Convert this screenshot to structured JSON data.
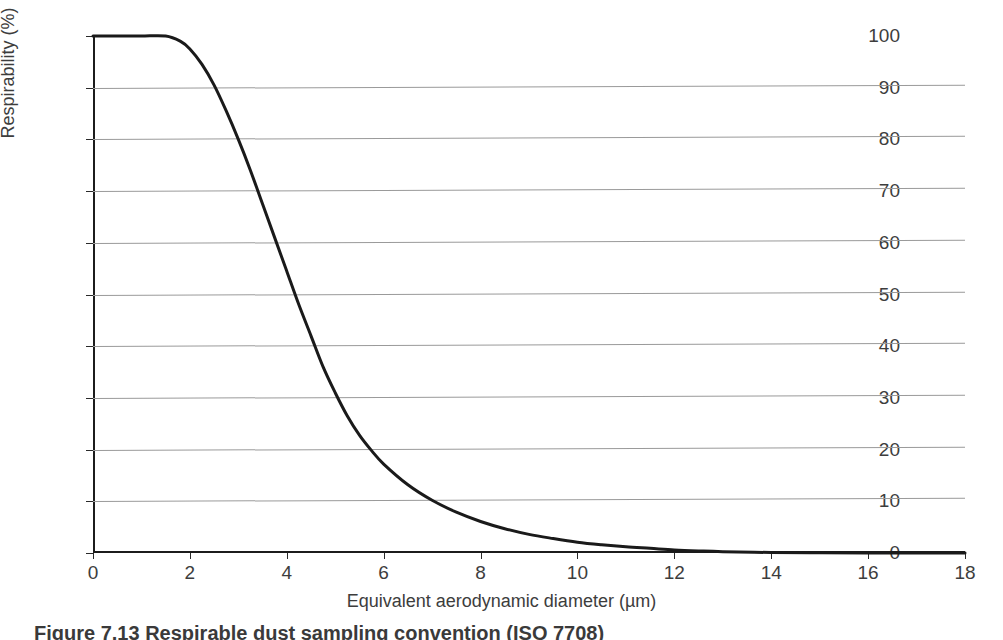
{
  "chart_data": {
    "type": "line",
    "title": "",
    "xlabel": "Equivalent aerodynamic diameter (µm)",
    "ylabel": "Respirability (%)",
    "xlim": [
      0,
      18
    ],
    "ylim": [
      0,
      100
    ],
    "xticks": [
      0,
      2,
      4,
      6,
      8,
      10,
      12,
      14,
      16,
      18
    ],
    "yticks": [
      0,
      10,
      20,
      30,
      40,
      50,
      60,
      70,
      80,
      90,
      100
    ],
    "xtick_labels": [
      "0",
      "2",
      "4",
      "6",
      "8",
      "10",
      "12",
      "14",
      "16",
      "18"
    ],
    "ytick_labels": [
      "0",
      "10",
      "20",
      "30",
      "40",
      "50",
      "60",
      "70",
      "80",
      "90",
      "100"
    ],
    "grid": "horizontal",
    "legend": "none",
    "series": [
      {
        "name": "Respirable convention (ISO 7708)",
        "color": "#1a1a1a",
        "x": [
          0.0,
          0.5,
          1.0,
          1.5,
          1.8,
          2.0,
          2.25,
          2.5,
          2.75,
          3.0,
          3.25,
          3.5,
          3.75,
          4.0,
          4.25,
          4.5,
          4.75,
          5.0,
          5.25,
          5.5,
          5.75,
          6.0,
          6.5,
          7.0,
          7.5,
          8.0,
          8.5,
          9.0,
          9.5,
          10.0,
          10.5,
          11.0,
          11.5,
          12.0,
          12.5,
          13.0,
          14.0,
          15.0,
          16.0,
          17.0,
          18.0
        ],
        "y": [
          100.0,
          100.0,
          100.0,
          100.0,
          99.0,
          97.5,
          94.5,
          90.5,
          85.5,
          80.0,
          74.0,
          67.5,
          61.0,
          54.5,
          48.0,
          42.0,
          36.0,
          31.0,
          26.5,
          22.8,
          19.8,
          17.2,
          13.2,
          10.2,
          7.9,
          6.1,
          4.7,
          3.6,
          2.8,
          2.1,
          1.6,
          1.2,
          0.9,
          0.6,
          0.4,
          0.25,
          0.1,
          0.05,
          0.02,
          0.01,
          0.0
        ]
      }
    ]
  },
  "caption": {
    "text": "Figure 7.13 Respirable dust sampling convention (ISO 7708)"
  }
}
